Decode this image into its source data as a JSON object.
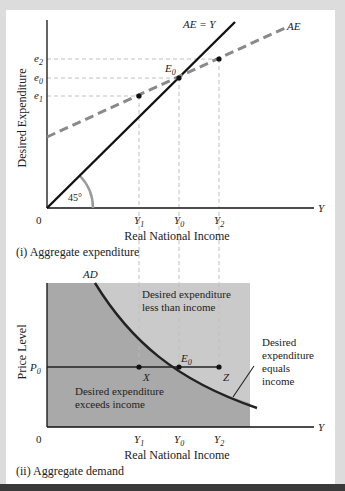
{
  "figure": {
    "top_chart": {
      "caption": "(i) Aggregate expenditure",
      "ylabel": "Desired Expenditure",
      "xlabel": "Real National Income",
      "x_axis_end_label": "Y",
      "origin_label": "0",
      "angle_label": "45°",
      "lines": {
        "ae_equals_y": "AE = Y",
        "ae": "AE"
      },
      "point_label": "E",
      "point_sub": "0",
      "y_ticks": [
        {
          "base": "e",
          "sub": "2"
        },
        {
          "base": "e",
          "sub": "0"
        },
        {
          "base": "e",
          "sub": "1"
        }
      ],
      "x_ticks": [
        {
          "base": "Y",
          "sub": "1"
        },
        {
          "base": "Y",
          "sub": "0"
        },
        {
          "base": "Y",
          "sub": "2"
        }
      ]
    },
    "bottom_chart": {
      "caption": "(ii) Aggregate demand",
      "ylabel": "Price Level",
      "xlabel": "Real National Income",
      "x_axis_end_label": "Y",
      "origin_label": "0",
      "curve_label": "AD",
      "price_label": {
        "base": "P",
        "sub": "0"
      },
      "point_labels": {
        "x": "X",
        "e": "E",
        "e_sub": "0",
        "z": "Z"
      },
      "region_upper": [
        "Desired expenditure",
        "less than income"
      ],
      "region_lower": [
        "Desired expenditure",
        "exceeds income"
      ],
      "annotation": [
        "Desired",
        "expenditure",
        "equals",
        "income"
      ],
      "x_ticks": [
        {
          "base": "Y",
          "sub": "1"
        },
        {
          "base": "Y",
          "sub": "0"
        },
        {
          "base": "Y",
          "sub": "2"
        }
      ]
    },
    "colors": {
      "dark_region": "#a9a9a9",
      "light_region": "#cacaca",
      "ae_dashed": "#8a8a8a",
      "frame": "#dcdcdc"
    }
  }
}
